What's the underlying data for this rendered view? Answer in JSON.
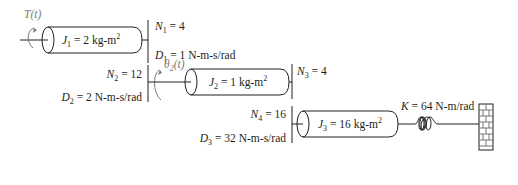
{
  "diagram": {
    "type": "rotational mechanical system with gear train",
    "input": {
      "torque_label": "T(t)"
    },
    "inertias": [
      {
        "symbol": "J",
        "sub": "1",
        "value": "2 kg-m",
        "sup": "2"
      },
      {
        "symbol": "J",
        "sub": "2",
        "value": "1 kg-m",
        "sup": "2"
      },
      {
        "symbol": "J",
        "sub": "3",
        "value": "16 kg-m",
        "sup": "2"
      }
    ],
    "gears": [
      {
        "symbol": "N",
        "sub": "1",
        "value": "4"
      },
      {
        "symbol": "N",
        "sub": "2",
        "value": "12"
      },
      {
        "symbol": "N",
        "sub": "3",
        "value": "4"
      },
      {
        "symbol": "N",
        "sub": "4",
        "value": "16"
      }
    ],
    "dampers": [
      {
        "symbol": "D",
        "sub": "1",
        "value": " 1 N-m-s/rad"
      },
      {
        "symbol": "D",
        "sub": "2",
        "value": "2 N-m-s/rad"
      },
      {
        "symbol": "D",
        "sub": "3",
        "value": "32 N-m-s/rad"
      }
    ],
    "angle": {
      "symbol": "θ",
      "sub": "2",
      "arg": "(t)"
    },
    "spring": {
      "symbol": "K",
      "value": "64 N-m/rad"
    },
    "colors": {
      "ink": "#231f20",
      "annotation": "#777777"
    }
  }
}
